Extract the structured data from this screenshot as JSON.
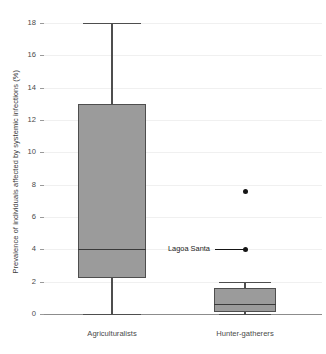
{
  "chart_data": {
    "type": "box",
    "title": "",
    "xlabel": "",
    "ylabel": "Prevalence of individuals affected by systemic infections (%)",
    "ylim": [
      0,
      18
    ],
    "ytick_values": [
      0,
      2,
      4,
      6,
      8,
      10,
      12,
      14,
      16,
      18
    ],
    "ytick_labels": [
      "0",
      "2",
      "4",
      "6",
      "8",
      "10",
      "12",
      "14",
      "16",
      "18"
    ],
    "grid": true,
    "legend": "none",
    "categories": [
      "Agriculturalists",
      "Hunter-gatherers"
    ],
    "boxes": [
      {
        "name": "Agriculturalists",
        "whisker_low": 0,
        "q1": 2.2,
        "median": 4.0,
        "q3": 13.0,
        "whisker_high": 18.0,
        "outliers": []
      },
      {
        "name": "Hunter-gatherers",
        "whisker_low": 0.0,
        "q1": 0.1,
        "median": 0.6,
        "q3": 1.6,
        "whisker_high": 2.0,
        "outliers": [
          7.6,
          4.0
        ]
      }
    ],
    "annotations": [
      {
        "text": "Lagoa Santa",
        "target_series": "Hunter-gatherers",
        "target_value": 4.0
      }
    ]
  },
  "colors": {
    "box_fill": "#9b9b9b",
    "box_edge": "#4e4e4e",
    "median": "#3a3a3a",
    "outlier": "#151515",
    "grid": "#f0f0f0",
    "axis": "#8c8c8c",
    "text": "#4a4a4a",
    "background": "#ffffff"
  }
}
